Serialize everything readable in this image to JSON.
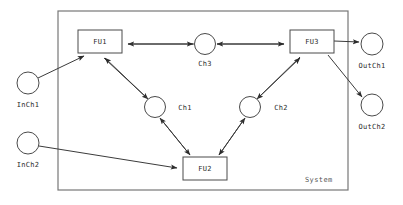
{
  "diagram": {
    "title": "System",
    "boundary": {
      "label": "System",
      "x": 58,
      "y": 11,
      "width": 290,
      "height": 179
    },
    "units": [
      {
        "id": "FU1",
        "label": "FU1",
        "x": 78,
        "y": 30,
        "width": 44,
        "height": 23
      },
      {
        "id": "FU3",
        "label": "FU3",
        "x": 290,
        "y": 30,
        "width": 44,
        "height": 23
      },
      {
        "id": "FU2",
        "label": "FU2",
        "x": 183,
        "y": 157,
        "width": 44,
        "height": 23
      }
    ],
    "channels": [
      {
        "id": "Ch3",
        "label": "Ch3",
        "cx": 205,
        "cy": 44,
        "r": 10.5,
        "label_x": 205,
        "label_y": 66
      },
      {
        "id": "Ch1",
        "label": "Ch1",
        "cx": 155,
        "cy": 107,
        "r": 10.5,
        "label_x": 185,
        "label_y": 110
      },
      {
        "id": "Ch2",
        "label": "Ch2",
        "cx": 250,
        "cy": 107,
        "r": 10.5,
        "label_x": 281,
        "label_y": 110
      }
    ],
    "external_ports": [
      {
        "id": "InCh1",
        "label": "InCh1",
        "cx": 28,
        "cy": 83,
        "r": 11,
        "label_x": 28,
        "label_y": 107
      },
      {
        "id": "InCh2",
        "label": "InCh2",
        "cx": 28,
        "cy": 143,
        "r": 11,
        "label_x": 28,
        "label_y": 167
      },
      {
        "id": "OutCh1",
        "label": "OutCh1",
        "cx": 372,
        "cy": 44,
        "r": 11,
        "label_x": 372,
        "label_y": 68
      },
      {
        "id": "OutCh2",
        "label": "OutCh2",
        "cx": 372,
        "cy": 105,
        "r": 11,
        "label_x": 372,
        "label_y": 129
      }
    ],
    "edges": [
      {
        "id": "edge-inch1-fu1",
        "from": "InCh1",
        "to": "FU1"
      },
      {
        "id": "edge-inch2-fu2",
        "from": "InCh2",
        "to": "FU2"
      },
      {
        "id": "edge-ch3-fu1",
        "from": "Ch3",
        "to": "FU1"
      },
      {
        "id": "edge-ch3-fu3",
        "from": "Ch3",
        "to": "FU3"
      },
      {
        "id": "edge-fu1-ch1",
        "from": "FU1",
        "to": "Ch1"
      },
      {
        "id": "edge-fu2-ch1",
        "from": "FU2",
        "to": "Ch1"
      },
      {
        "id": "edge-fu3-ch2",
        "from": "FU3",
        "to": "Ch2"
      },
      {
        "id": "edge-fu2-ch2",
        "from": "FU2",
        "to": "Ch2"
      },
      {
        "id": "edge-fu3-outch1",
        "from": "FU3",
        "to": "OutCh1"
      },
      {
        "id": "edge-fu3-outch2",
        "from": "FU3",
        "to": "OutCh2"
      }
    ]
  }
}
